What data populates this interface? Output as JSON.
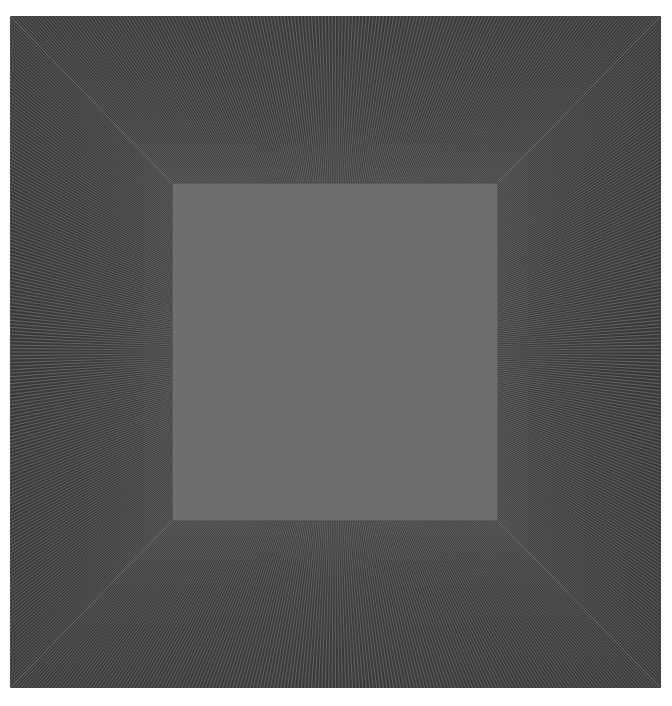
{
  "artwork": {
    "description": "Radiating line field surrounding a flat gray square",
    "colors": {
      "background": "#ffffff",
      "field": "#3a3a3a",
      "line": "#8a8a8a",
      "inner_square": "#6e6e6e",
      "inner_border": "#4a4a4a"
    },
    "lines_per_side": 190
  }
}
